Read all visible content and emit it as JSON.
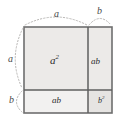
{
  "figure": {
    "name": "binomial-square-area-diagram",
    "identity": "(a+b)^2 = a^2 + 2ab + b^2",
    "colors": {
      "background": "#ffffff",
      "cell_fill": "#efeeec",
      "cell_fill_light": "#f4f3f2",
      "border_stroke": "#6e6e6e",
      "divider_stroke": "#5f5f5f",
      "dotted_stroke": "#b9b7b5",
      "label_text": "#2b2b2b",
      "dim_text": "#4a4a4a"
    },
    "geometry": {
      "square_left": 24,
      "square_top": 27,
      "square_right": 112,
      "square_bottom": 113,
      "divider_x": 88,
      "divider_y": 90
    }
  },
  "cells": [
    {
      "id": "a-squared",
      "label": "a",
      "exponent": "2",
      "region": "top-left",
      "area_expr": "a^2"
    },
    {
      "id": "ab-right",
      "label": "ab",
      "exponent": "",
      "region": "top-right",
      "area_expr": "ab"
    },
    {
      "id": "ab-bottom",
      "label": "ab",
      "exponent": "",
      "region": "bottom-left",
      "area_expr": "ab"
    },
    {
      "id": "b-squared",
      "label": "b",
      "exponent": "2",
      "region": "bottom-right",
      "area_expr": "b^2"
    }
  ],
  "dimensions": {
    "top_a": "a",
    "top_b": "b",
    "left_a": "a",
    "left_b": "b"
  },
  "markers": {
    "style": "dotted-arc",
    "top_arc_a": "arc spanning the a-width along the top edge",
    "top_arc_b": "arc spanning the b-width along the top-right edge",
    "left_arc_a": "arc spanning the a-height along the left edge",
    "left_arc_b": "arc spanning the b-height along the lower-left edge"
  }
}
